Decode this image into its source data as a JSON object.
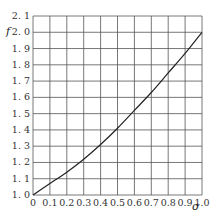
{
  "chart_data": {
    "type": "line",
    "title": "",
    "xlabel": "σ",
    "ylabel": "f",
    "xlim": [
      0,
      1.0
    ],
    "ylim": [
      1.0,
      2.1
    ],
    "grid": true,
    "legend": null,
    "x_ticks": [
      "0",
      "0.1",
      "0.2",
      "0.3",
      "0.4",
      "0.5",
      "0.6",
      "0.7",
      "0.8",
      "0.9",
      "1.0"
    ],
    "y_ticks": [
      "1.0",
      "1.1",
      "1.2",
      "1.3",
      "1.4",
      "1.5",
      "1.6",
      "1.7",
      "1.8",
      "1.9",
      "2.0",
      "2.1"
    ],
    "series": [
      {
        "name": "f(σ)",
        "x": [
          0,
          0.1,
          0.2,
          0.3,
          0.4,
          0.5,
          0.6,
          0.7,
          0.8,
          0.9,
          1.0
        ],
        "values": [
          1.0,
          1.07,
          1.14,
          1.22,
          1.31,
          1.41,
          1.52,
          1.63,
          1.75,
          1.87,
          2.0
        ]
      }
    ]
  }
}
